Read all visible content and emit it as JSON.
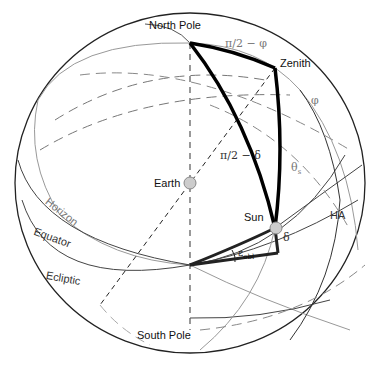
{
  "diagram": {
    "labels": {
      "north_pole": "North Pole",
      "south_pole": "South Pole",
      "zenith": "Zenith",
      "earth": "Earth",
      "sun": "Sun",
      "horizon": "Horizon",
      "equator": "Equator",
      "ecliptic": "Ecliptic",
      "hour_angle": "HA",
      "colatitude": "π/2 − φ",
      "latitude": "φ",
      "latitude_top": "φ",
      "codeclination": "π/2 − δ",
      "zenith_angle": "θ",
      "zenith_angle_sub": "s",
      "declination": "δ",
      "obliquity": "ε",
      "obliquity_sub": "obl"
    },
    "colors": {
      "outline": "#222222",
      "thick_triangle": "#000000",
      "gray_line": "#999999",
      "dashed": "#555555",
      "marker_fill": "#cccccc"
    }
  }
}
